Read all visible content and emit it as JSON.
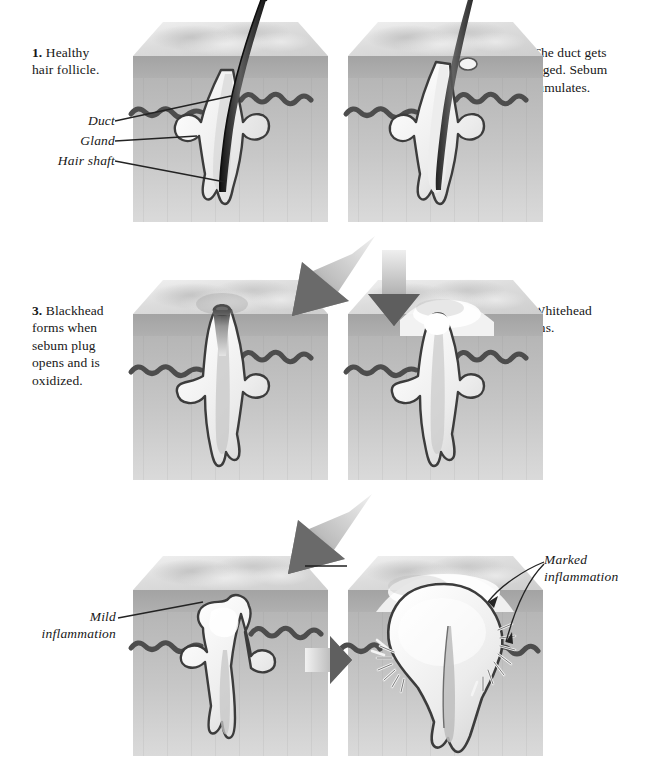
{
  "figure": {
    "background_color": "#ffffff",
    "ink_color": "#171717"
  },
  "palette": {
    "surface_light": "#e9e9e9",
    "surface_mid": "#d2d2d2",
    "surface_shadow": "#b9b9b9",
    "epidermis": "#a8a8a8",
    "dermis_top": "#c0c0c0",
    "dermis_bottom": "#d6d6d6",
    "outline": "#3a3a3a",
    "wavy_line": "#4a4a4a",
    "sebum_fill": "#f2f2f2",
    "hair_dark": "#222222",
    "arrow_dark": "#6e6e6e",
    "arrow_light": "#e6e6e6",
    "blackhead": "#2e2e2e"
  },
  "panels": [
    {
      "id": "panel-1",
      "number": "1",
      "caption_number": "1.",
      "caption_text": " Healthy\nhair follicle.",
      "caption_full": "1. Healthy hair follicle.",
      "caption_side": "left",
      "labels": [
        {
          "id": "label-duct",
          "text": "Duct",
          "align": "right"
        },
        {
          "id": "label-gland",
          "text": "Gland",
          "align": "right"
        },
        {
          "id": "label-hair-shaft",
          "text": "Hair shaft",
          "align": "right"
        }
      ]
    },
    {
      "id": "panel-2",
      "number": "2",
      "caption_number": "2.",
      "caption_text": " The duct gets\nclogged. Sebum\naccumulates.",
      "caption_full": "2. The duct gets clogged. Sebum accumulates.",
      "caption_side": "right",
      "labels": []
    },
    {
      "id": "panel-3",
      "number": "3",
      "caption_number": "3.",
      "caption_text": " Blackhead\nforms when\nsebum plug\nopens and is\noxidized.",
      "caption_full": "3. Blackhead forms when sebum plug opens and is oxidized.",
      "caption_side": "left",
      "labels": []
    },
    {
      "id": "panel-4",
      "number": "4",
      "caption_number": "4.",
      "caption_text": " Whitehead\nforms.",
      "caption_full": "4. Whitehead forms.",
      "caption_side": "right",
      "labels": []
    },
    {
      "id": "panel-5a",
      "number": "5",
      "caption_number": "5.",
      "caption_text": "",
      "caption_full": "5.",
      "caption_side": "center",
      "labels": [
        {
          "id": "label-mild-inflammation",
          "text": "Mild\ninflammation",
          "align": "right"
        }
      ]
    },
    {
      "id": "panel-5b",
      "number": "",
      "caption_number": "",
      "caption_text": "",
      "caption_full": "",
      "caption_side": "none",
      "labels": [
        {
          "id": "label-marked-inflammation",
          "text": "Marked\ninflammation",
          "align": "left"
        }
      ]
    }
  ],
  "arrows": [
    {
      "id": "arrow-2-to-3",
      "direction": "down-left",
      "from": "panel-2",
      "to": "panel-3"
    },
    {
      "id": "arrow-2-to-4",
      "direction": "down",
      "from": "panel-2",
      "to": "panel-4"
    },
    {
      "id": "arrow-4-to-5",
      "direction": "down-left",
      "from": "panel-4",
      "to": "panel-5a"
    },
    {
      "id": "arrow-5a-to-5b",
      "direction": "right",
      "from": "panel-5a",
      "to": "panel-5b"
    }
  ]
}
